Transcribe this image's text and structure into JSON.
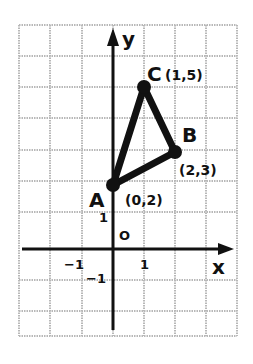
{
  "diagram": {
    "type": "coordinate-plane-triangle",
    "axes": {
      "x_label": "x",
      "y_label": "y",
      "origin_label": "O"
    },
    "ticks": {
      "x_neg": "−1",
      "x_pos": "1",
      "y_pos": "1",
      "y_neg": "−1"
    },
    "points": [
      {
        "name": "A",
        "coord_label": "(0,2)",
        "x": 0,
        "y": 2
      },
      {
        "name": "B",
        "coord_label": "(2,3)",
        "x": 2,
        "y": 3
      },
      {
        "name": "C",
        "coord_label": "(1,5)",
        "x": 1,
        "y": 5
      }
    ],
    "grid": {
      "columns": 7,
      "rows": 10,
      "x_range": [
        -3,
        4
      ],
      "y_range": [
        -3,
        7
      ]
    },
    "colors": {
      "ink": "#111111",
      "grid": "#b8b8b8",
      "background": "#ffffff"
    }
  }
}
